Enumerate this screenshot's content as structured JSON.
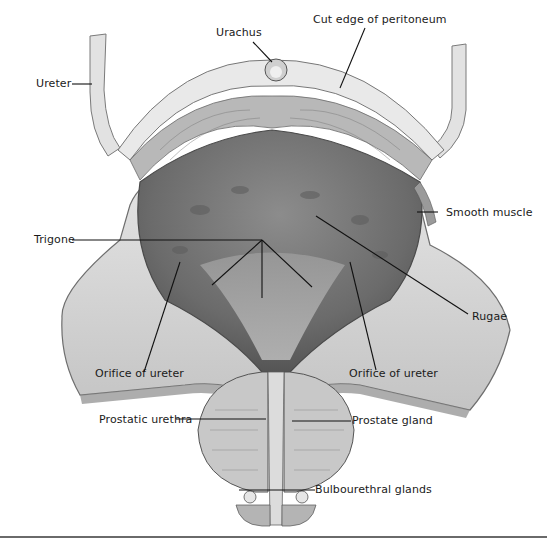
{
  "figure": {
    "type": "anatomical illustration"
  },
  "labels": {
    "urachus": "Urachus",
    "cut_edge": "Cut edge of peritoneum",
    "ureter": "Ureter",
    "smooth_muscle": "Smooth muscle",
    "trigone": "Trigone",
    "rugae": "Rugae",
    "orifice_left": "Orifice of ureter",
    "orifice_right": "Orifice of ureter",
    "prostatic_urethra": "Prostatic urethra",
    "prostate_gland": "Prostate gland",
    "bulbourethral": "Bulbourethral glands"
  },
  "colors": {
    "tissue_light": "#d9d9d9",
    "tissue_mid": "#a8a8a8",
    "lumen_dark": "#6e6e6e",
    "outline": "#4a4a4a",
    "leader": "#111111"
  }
}
